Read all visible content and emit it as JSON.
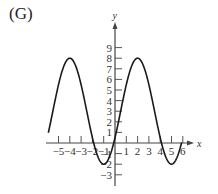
{
  "panel": {
    "label": "(G)"
  },
  "chart_data": {
    "type": "line",
    "title": "",
    "xlabel": "x",
    "ylabel": "y",
    "xlim": [
      -6.3,
      6.6
    ],
    "ylim": [
      -4,
      10
    ],
    "grid": false,
    "x_ticks": [
      -5,
      -4,
      -3,
      -2,
      -1,
      1,
      2,
      3,
      4,
      5,
      6
    ],
    "x_tick_labels": [
      "−5",
      "−4",
      "−3",
      "−2",
      "−1",
      "1",
      "2",
      "3",
      "4",
      "5",
      "6"
    ],
    "y_ticks": [
      -3,
      -2,
      -1,
      1,
      2,
      3,
      4,
      5,
      6,
      7,
      8,
      9
    ],
    "y_tick_labels": [
      "−3",
      "−2",
      "−1",
      "1",
      "2",
      "3",
      "4",
      "5",
      "6",
      "7",
      "8",
      "9"
    ],
    "series": [
      {
        "name": "curve",
        "description": "sinusoid, max 8 at x=2, min -2 at x=-1 and x=5",
        "x": [
          -6.1,
          -5.5,
          -5,
          -4.5,
          -4,
          -3.5,
          -3,
          -2.5,
          -2,
          -1.5,
          -1,
          -0.5,
          0,
          0.5,
          1,
          1.5,
          2,
          2.5,
          3,
          3.5,
          4,
          4.5,
          5,
          5.5,
          6
        ],
        "y": [
          7.9,
          7.33,
          5.5,
          3.0,
          0.5,
          -1.33,
          -2.0,
          -1.33,
          0.5,
          3.0,
          5.5,
          7.33,
          8.0,
          7.33,
          5.5,
          3.0,
          0.5,
          -1.33,
          -2.0,
          -1.33,
          0.5,
          3.0,
          5.5,
          7.33,
          8.0
        ]
      }
    ],
    "key_points": {
      "maxima": [
        [
          -5.8,
          8
        ],
        [
          2,
          8
        ]
      ],
      "minima": [
        [
          -1,
          -2
        ],
        [
          5,
          -2
        ]
      ]
    }
  }
}
